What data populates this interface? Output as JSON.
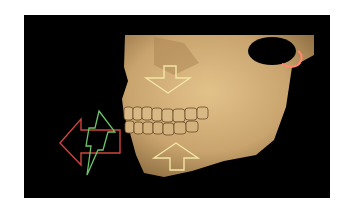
{
  "figure": {
    "background_color": "#000000",
    "bone_color": "#c9a46e",
    "annotations": [
      {
        "id": "arrow-down-maxilla",
        "shape": "outlined-arrow-down",
        "color": "#f2e6a6"
      },
      {
        "id": "arrow-up-mandible",
        "shape": "outlined-arrow-up",
        "color": "#f2e6a6"
      },
      {
        "id": "arrow-left-forward",
        "shape": "outlined-arrow-left",
        "color": "#d0443c"
      },
      {
        "id": "lightning-bolt",
        "shape": "outlined-lightning",
        "color": "#6cc46a"
      },
      {
        "id": "tmj-arc",
        "shape": "arc",
        "color": "#ff8a6e"
      }
    ]
  }
}
